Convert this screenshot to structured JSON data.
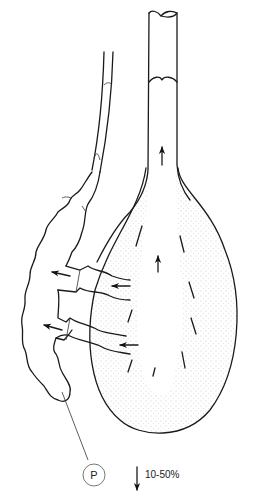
{
  "diagram": {
    "label_marker": "P",
    "flow_percentage": "10-50%",
    "colors": {
      "line": "#1a1a1a",
      "stipple": "#9a9a9a",
      "background": "#ffffff"
    }
  }
}
